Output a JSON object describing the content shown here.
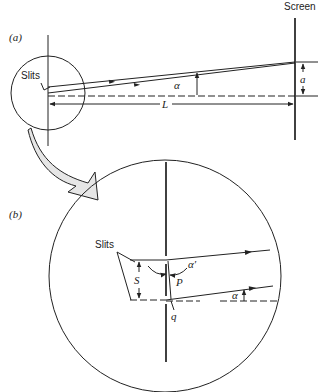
{
  "diagram": {
    "panel_a": {
      "label": "(a)",
      "slits_label": "Slits",
      "screen_label": "Screen",
      "angle_label": "α",
      "distance_label": "L",
      "offset_label": "a"
    },
    "panel_b": {
      "label": "(b)",
      "slits_label": "Slits",
      "separation_label": "S",
      "angle_prime_label": "α′",
      "angle_label": "α",
      "point_p_label": "P",
      "point_q_label": "q"
    },
    "colors": {
      "line": "#222222",
      "zoom_arrow_fill": "#e6e6e6",
      "background": "#ffffff"
    }
  }
}
